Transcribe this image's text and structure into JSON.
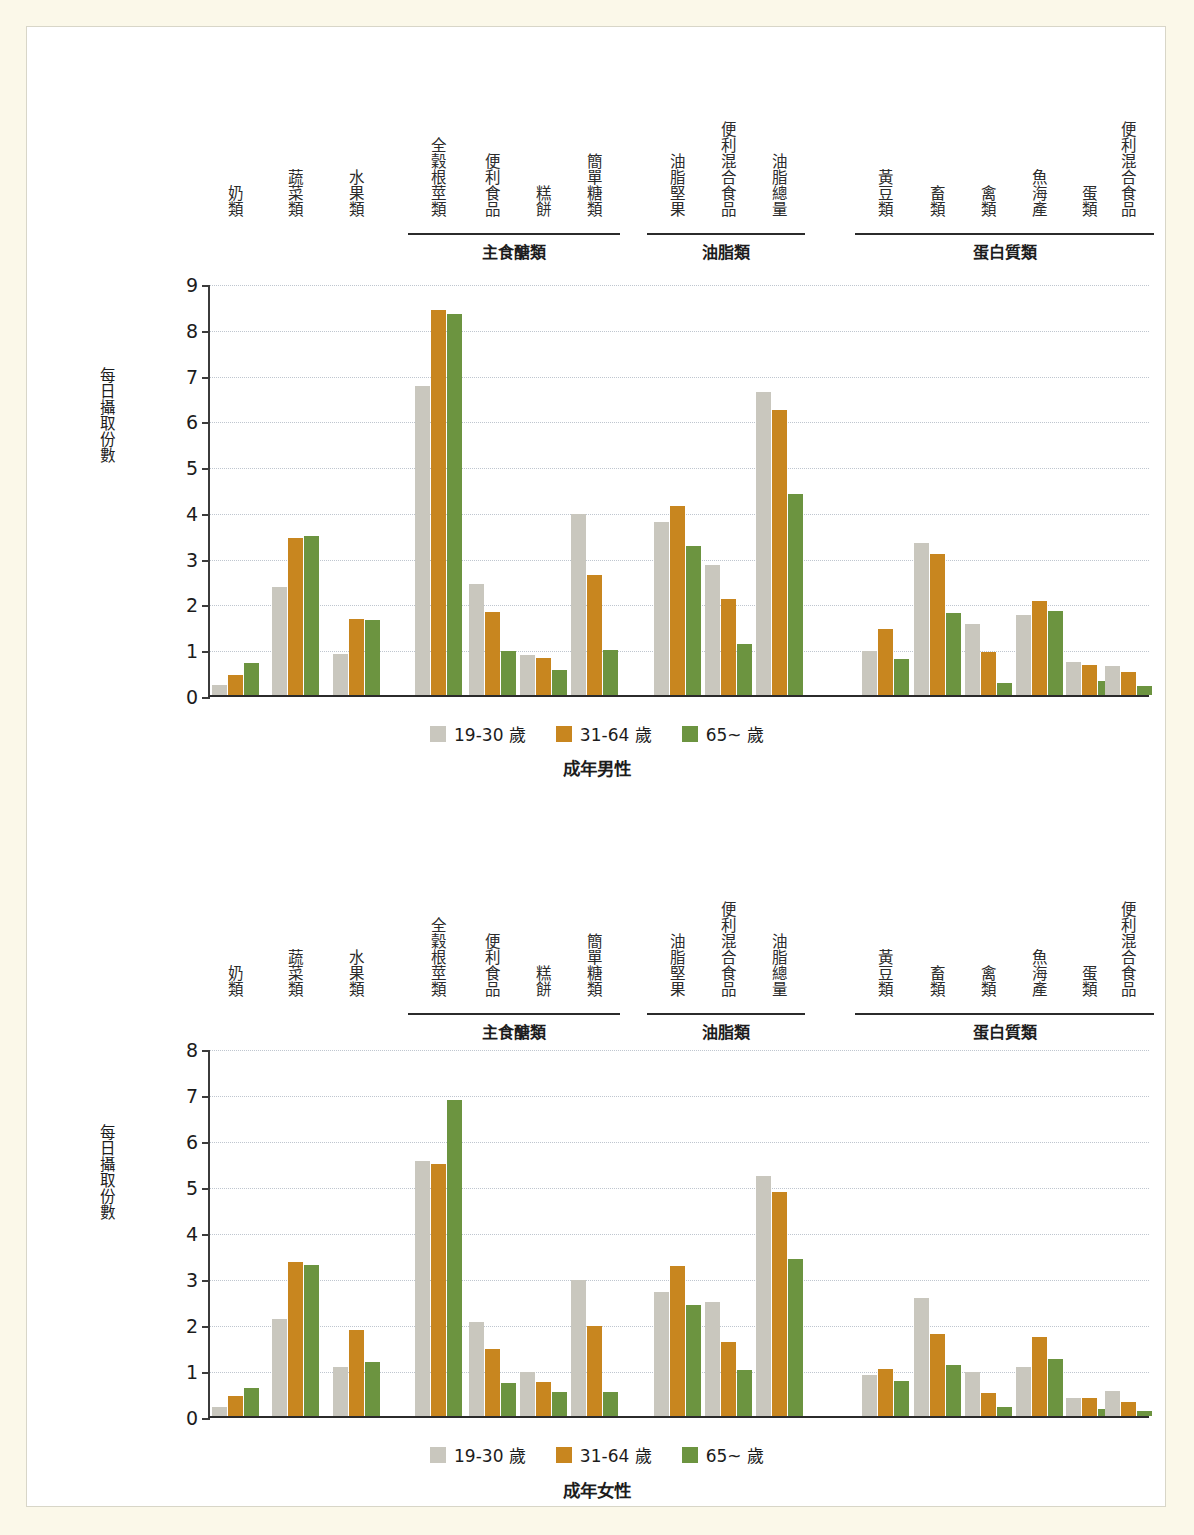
{
  "colors": {
    "series_19_30": "#c9c7be",
    "series_31_64": "#c8861f",
    "series_65": "#6c9440",
    "page_background": "#fbf8e9",
    "panel_background": "#ffffff",
    "axis": "#2b2b2b",
    "grid": "#bfc6cf"
  },
  "legend": {
    "items": [
      {
        "label": "19-30 歲",
        "color_key": "series_19_30"
      },
      {
        "label": "31-64 歲",
        "color_key": "series_31_64"
      },
      {
        "label": "65~ 歲",
        "color_key": "series_65"
      }
    ]
  },
  "axis": {
    "ylabel": "每日攝取份數"
  },
  "groups": [
    {
      "name": "主食醣類",
      "start_index": 3,
      "end_index": 6
    },
    {
      "name": "油脂類",
      "start_index": 7,
      "end_index": 9
    },
    {
      "name": "蛋白質類",
      "start_index": 10,
      "end_index": 15
    }
  ],
  "categories": [
    "奶類",
    "蔬菜類",
    "水果類",
    "全穀根莖類",
    "便利食品",
    "糕餅",
    "簡單糖類",
    "油脂堅果",
    "便利混合食品",
    "油脂總量",
    "黃豆類",
    "畜類",
    "禽類",
    "魚海產",
    "蛋類",
    "便利混合食品"
  ],
  "chart_data": [
    {
      "type": "bar",
      "title": "成年男性",
      "ylabel": "每日攝取份數",
      "xlabel": "",
      "ylim": [
        0,
        9
      ],
      "yticks": [
        0,
        1,
        2,
        3,
        4,
        5,
        6,
        7,
        8,
        9
      ],
      "grid": true,
      "legend_position": "bottom",
      "categories": [
        "奶類",
        "蔬菜類",
        "水果類",
        "全穀根莖類",
        "便利食品",
        "糕餅",
        "簡單糖類",
        "油脂堅果",
        "便利混合食品",
        "油脂總量",
        "黃豆類",
        "畜類",
        "禽類",
        "魚海產",
        "蛋類",
        "便利混合食品"
      ],
      "series": [
        {
          "name": "19-30 歲",
          "values": [
            0.22,
            2.35,
            0.9,
            6.75,
            2.42,
            0.88,
            3.95,
            3.78,
            2.85,
            6.62,
            0.96,
            3.31,
            1.55,
            1.75,
            0.72,
            0.64
          ]
        },
        {
          "name": "31-64 歲",
          "values": [
            0.44,
            3.42,
            1.66,
            8.42,
            1.82,
            0.8,
            2.63,
            4.12,
            2.1,
            6.22,
            1.45,
            3.08,
            0.95,
            2.05,
            0.66,
            0.5
          ]
        },
        {
          "name": "65~ 歲",
          "values": [
            0.7,
            3.48,
            1.64,
            8.32,
            0.96,
            0.55,
            0.98,
            3.26,
            1.12,
            4.4,
            0.78,
            1.8,
            0.27,
            1.83,
            0.31,
            0.2
          ]
        }
      ]
    },
    {
      "type": "bar",
      "title": "成年女性",
      "ylabel": "每日攝取份數",
      "xlabel": "",
      "ylim": [
        0,
        8
      ],
      "yticks": [
        0,
        1,
        2,
        3,
        4,
        5,
        6,
        7,
        8
      ],
      "grid": true,
      "legend_position": "bottom",
      "categories": [
        "奶類",
        "蔬菜類",
        "水果類",
        "全穀根莖類",
        "便利食品",
        "糕餅",
        "簡單糖類",
        "油脂堅果",
        "便利混合食品",
        "油脂總量",
        "黃豆類",
        "畜類",
        "禽類",
        "魚海產",
        "蛋類",
        "便利混合食品"
      ],
      "series": [
        {
          "name": "19-30 歲",
          "values": [
            0.2,
            2.1,
            1.07,
            5.55,
            2.05,
            0.96,
            2.95,
            2.7,
            2.47,
            5.22,
            0.9,
            2.57,
            0.95,
            1.07,
            0.4,
            0.55
          ]
        },
        {
          "name": "31-64 歲",
          "values": [
            0.43,
            3.35,
            1.88,
            5.48,
            1.46,
            0.73,
            1.95,
            3.26,
            1.6,
            4.88,
            1.03,
            1.78,
            0.5,
            1.72,
            0.39,
            0.31
          ]
        },
        {
          "name": "65~ 歲",
          "values": [
            0.6,
            3.28,
            1.18,
            6.88,
            0.72,
            0.53,
            0.53,
            2.42,
            1.0,
            3.42,
            0.76,
            1.1,
            0.2,
            1.25,
            0.15,
            0.1
          ]
        }
      ]
    }
  ]
}
